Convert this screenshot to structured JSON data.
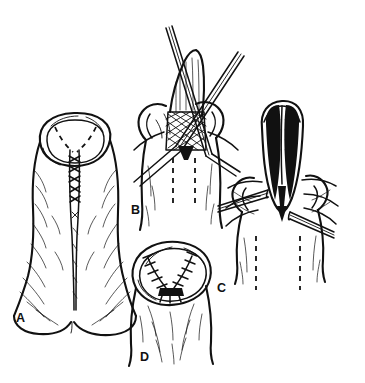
{
  "figure": {
    "style": "black and white pen-and-ink medical illustration",
    "background_color": "#ffffff",
    "ink_color": "#111111",
    "panel_count": 4
  },
  "panels": [
    {
      "id": "A",
      "label": "A",
      "label_x": 16,
      "label_y": 322,
      "description": "Shaft with circular preputial opening at top, dashed V-shaped incision marking, vertical sutured midline running down to scrotal base"
    },
    {
      "id": "B",
      "label": "B",
      "label_x": 131,
      "label_y": 214,
      "description": "Tissue held by two crossing forceps, cross-hatched everted tissue at center, two vertical dashed lines below"
    },
    {
      "id": "C",
      "label": "C",
      "label_x": 217,
      "label_y": 292,
      "description": "Opened field retracted by two instruments showing dark cross-hatched bilateral flaps separated by a pale V cleft, two vertical dashed lines below"
    },
    {
      "id": "D",
      "label": "D",
      "label_x": 140,
      "label_y": 361,
      "description": "Completed closure: rounded stump with chevron of interrupted sutures converging to a dark central line"
    }
  ],
  "markings": {
    "dashed_incision_label": "dashed incision line",
    "suture_label": "interrupted sutures",
    "hatching_label": "cross-hatched tissue",
    "instrument_label": "forceps"
  }
}
